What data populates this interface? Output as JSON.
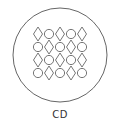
{
  "diagram": {
    "label": "CD",
    "outer_shape": "circle",
    "stroke_color": "#666666",
    "grid": {
      "rows": 4,
      "cols": 5,
      "cells": [
        [
          "diamond",
          "circle",
          "diamond",
          "circle",
          "diamond"
        ],
        [
          "circle",
          "diamond",
          "circle",
          "diamond",
          "circle"
        ],
        [
          "diamond",
          "circle",
          "diamond",
          "circle",
          "diamond"
        ],
        [
          "circle",
          "diamond",
          "circle",
          "diamond",
          "circle"
        ]
      ]
    }
  }
}
